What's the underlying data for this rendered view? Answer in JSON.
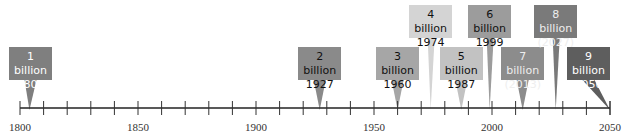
{
  "axis": {
    "start_year": 1800,
    "end_year": 2055,
    "tick_interval": 10,
    "labels": [
      "1800",
      "1850",
      "1900",
      "1950",
      "2000",
      "2050"
    ],
    "label_years": [
      1800,
      1850,
      1900,
      1950,
      2000,
      2050
    ]
  },
  "milestones": [
    {
      "population": "1 billion",
      "year": "1804",
      "year_value": 1804,
      "row": "low",
      "color": "#7f7f7f",
      "text_color": "#ffffff"
    },
    {
      "population": "2 billion",
      "year": "1927",
      "year_value": 1927,
      "row": "low",
      "color": "#8a8a8a",
      "text_color": "#111111"
    },
    {
      "population": "3 billion",
      "year": "1960",
      "year_value": 1960,
      "row": "low",
      "color": "#a6a6a6",
      "text_color": "#111111"
    },
    {
      "population": "4 billion",
      "year": "1974",
      "year_value": 1974,
      "row": "high",
      "color": "#d4d4d4",
      "text_color": "#111111"
    },
    {
      "population": "5 billion",
      "year": "1987",
      "year_value": 1987,
      "row": "low",
      "color": "#c2c2c2",
      "text_color": "#111111"
    },
    {
      "population": "6 billion",
      "year": "1999",
      "year_value": 1999,
      "row": "high",
      "color": "#9c9c9c",
      "text_color": "#111111"
    },
    {
      "population": "7 billion",
      "year": "(2013)",
      "year_value": 2013,
      "row": "low",
      "color": "#8c8c8c",
      "text_color": "#eeeeee"
    },
    {
      "population": "8 billion",
      "year": "(2027)",
      "year_value": 2027,
      "row": "high",
      "color": "#7a7a7a",
      "text_color": "#eeeeee"
    },
    {
      "population": "9 billion",
      "year": "(2050)",
      "year_value": 2050,
      "row": "low",
      "color": "#5e5e5e",
      "text_color": "#ffffff"
    }
  ]
}
